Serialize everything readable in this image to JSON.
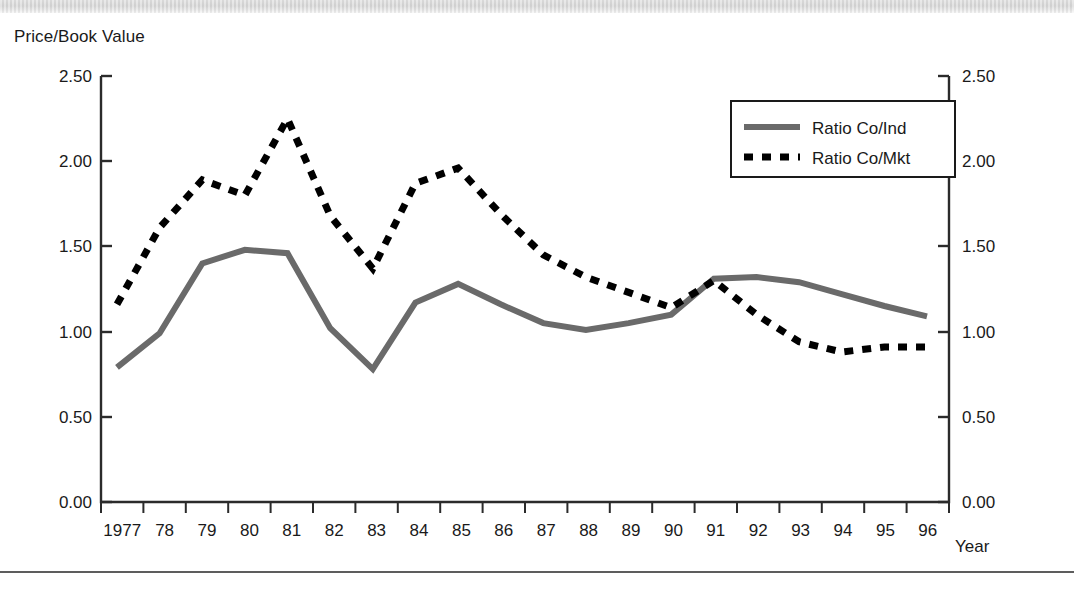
{
  "figure": {
    "ylabel_top": "Price/Book Value",
    "xlabel": "Year",
    "background_color": "#ffffff"
  },
  "legend": {
    "position": "top-right",
    "entries": [
      {
        "label": "Ratio Co/Ind",
        "style": "solid",
        "color": "#6a6a6a"
      },
      {
        "label": "Ratio Co/Mkt",
        "style": "dotted",
        "color": "#000000"
      }
    ]
  },
  "axes": {
    "y_left_ticks": [
      "2.50",
      "2.00",
      "1.50",
      "1.00",
      "0.50",
      "0.00"
    ],
    "y_right_ticks": [
      "2.50",
      "2.00",
      "1.50",
      "1.00",
      "0.50",
      "0.00"
    ],
    "x_ticks": [
      "1977",
      "78",
      "79",
      "80",
      "81",
      "82",
      "83",
      "84",
      "85",
      "86",
      "87",
      "88",
      "89",
      "90",
      "91",
      "92",
      "93",
      "94",
      "95",
      "96"
    ]
  },
  "chart_data": {
    "type": "line",
    "title": "",
    "xlabel": "Year",
    "ylabel": "Price/Book Value",
    "ylim": [
      0.0,
      2.5
    ],
    "ytick_step": 0.5,
    "grid": false,
    "legend_position": "upper right",
    "x": [
      1977,
      1978,
      1979,
      1980,
      1981,
      1982,
      1983,
      1984,
      1985,
      1986,
      1987,
      1988,
      1989,
      1990,
      1991,
      1992,
      1993,
      1994,
      1995,
      1996
    ],
    "categories": [
      "1977",
      "78",
      "79",
      "80",
      "81",
      "82",
      "83",
      "84",
      "85",
      "86",
      "87",
      "88",
      "89",
      "90",
      "91",
      "92",
      "93",
      "94",
      "95",
      "96"
    ],
    "series": [
      {
        "name": "Ratio Co/Ind",
        "style": "solid",
        "color": "#6a6a6a",
        "values": [
          0.79,
          0.99,
          1.4,
          1.48,
          1.46,
          1.02,
          0.78,
          1.17,
          1.28,
          1.16,
          1.05,
          1.01,
          1.05,
          1.1,
          1.31,
          1.32,
          1.29,
          1.22,
          1.15,
          1.09
        ]
      },
      {
        "name": "Ratio Co/Mkt",
        "style": "dotted",
        "color": "#000000",
        "values": [
          1.16,
          1.61,
          1.89,
          1.8,
          2.25,
          1.68,
          1.37,
          1.87,
          1.96,
          1.69,
          1.45,
          1.32,
          1.23,
          1.14,
          1.3,
          1.1,
          0.94,
          0.88,
          0.91,
          0.91
        ]
      }
    ]
  }
}
